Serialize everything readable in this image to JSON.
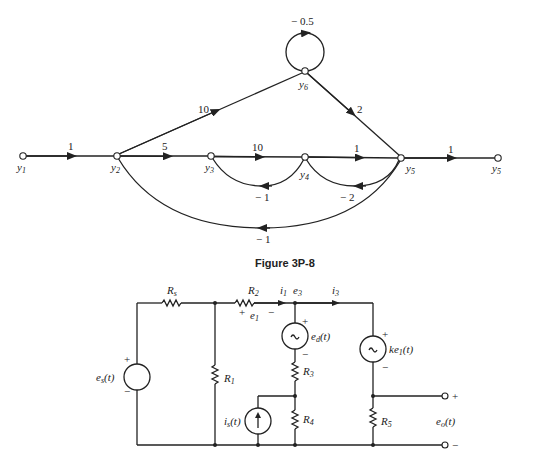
{
  "signal_flow_graph": {
    "nodes": {
      "y1": {
        "label": "y",
        "sub": "1"
      },
      "y2": {
        "label": "y",
        "sub": "2"
      },
      "y3": {
        "label": "y",
        "sub": "3"
      },
      "y4": {
        "label": "y",
        "sub": "4"
      },
      "y5": {
        "label": "y",
        "sub": "5"
      },
      "y5out": {
        "label": "y",
        "sub": "5"
      },
      "y6": {
        "label": "y",
        "sub": "6"
      }
    },
    "branches": {
      "y1_y2": "1",
      "y2_y3": "5",
      "y3_y4": "10",
      "y4_y5": "1",
      "y5_out": "1",
      "y2_y6": "10",
      "y6_y5": "2",
      "y6_self": "− 0.5",
      "y4_y3": "− 1",
      "y5_y4": "− 2",
      "y5_y2": "− 1"
    }
  },
  "caption": "Figure 3P-8",
  "circuit": {
    "Rs": {
      "main": "R",
      "sub": "s"
    },
    "R2": {
      "main": "R",
      "sub": "2"
    },
    "R1": {
      "main": "R",
      "sub": "1"
    },
    "R3": {
      "main": "R",
      "sub": "3"
    },
    "R4": {
      "main": "R",
      "sub": "4"
    },
    "R5": {
      "main": "R",
      "sub": "5"
    },
    "i1": {
      "main": "i",
      "sub": "1"
    },
    "e3": {
      "main": "e",
      "sub": "3"
    },
    "i3": {
      "main": "i",
      "sub": "3"
    },
    "e1": {
      "main": "e",
      "sub": "1"
    },
    "es": {
      "main": "e",
      "sub": "s",
      "arg": "(t)"
    },
    "ed": {
      "main": "e",
      "sub": "d",
      "arg": "(t)"
    },
    "ke1": {
      "main": "ke",
      "sub": "1",
      "arg": "(t)"
    },
    "is": {
      "main": "i",
      "sub": "s",
      "arg": "(t)"
    },
    "eo": {
      "main": "e",
      "sub": "o",
      "arg": "(t)"
    },
    "plus": "+",
    "minus": "−",
    "tilde": "~"
  }
}
